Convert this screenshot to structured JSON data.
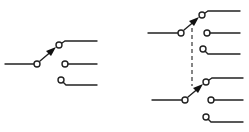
{
  "diagram": {
    "title": "",
    "type": "switch-schematic",
    "colors": {
      "line": "#222222",
      "background": "#ffffff"
    },
    "switches": [
      {
        "id": "single-pole-three-throw",
        "name": "SP3T switch",
        "contacts": 3,
        "selected_contact": 1,
        "group": "left"
      },
      {
        "id": "ganged-top",
        "name": "Ganged switch pole A",
        "contacts": 3,
        "selected_contact": 1,
        "group": "right"
      },
      {
        "id": "ganged-bottom",
        "name": "Ganged switch pole B",
        "contacts": 3,
        "selected_contact": 1,
        "group": "right"
      }
    ],
    "mechanical_link": {
      "style": "dashed",
      "connects": [
        "ganged-top",
        "ganged-bottom"
      ]
    }
  }
}
